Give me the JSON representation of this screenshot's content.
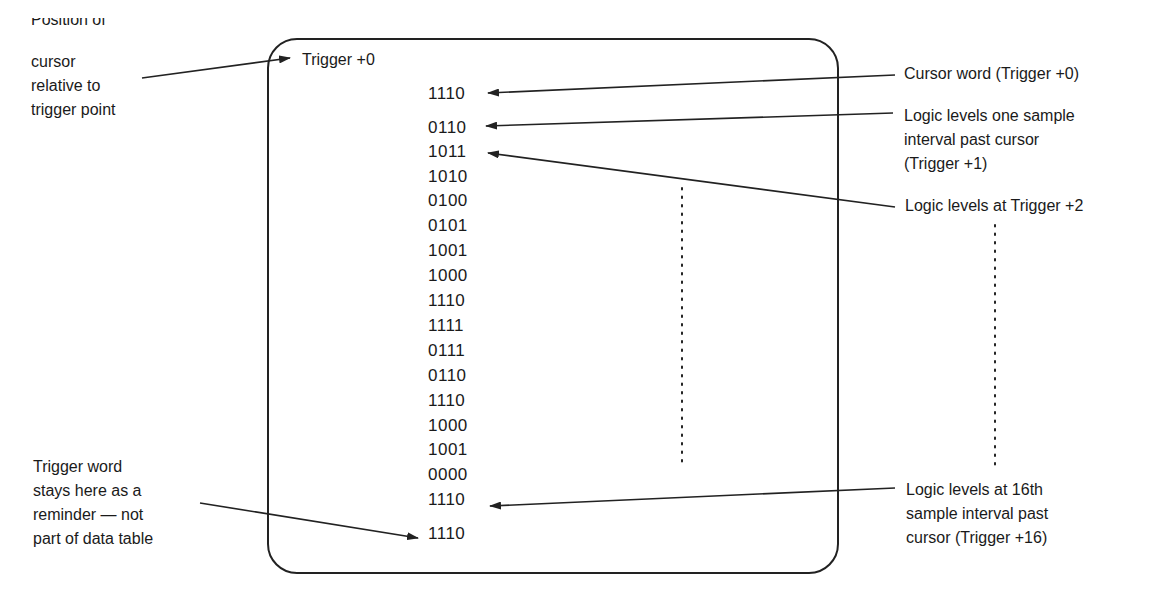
{
  "display": {
    "cursor_position_label": "Trigger +0",
    "data_rows": [
      "1110",
      "0110",
      "1011",
      "1010",
      "0100",
      "0101",
      "1001",
      "1000",
      "1110",
      "1111",
      "0111",
      "0110",
      "1110",
      "1000",
      "1001",
      "0000",
      "1110"
    ],
    "trigger_word_reminder": "1110"
  },
  "annotations": {
    "left": {
      "position_of_cursor_line1": "Position of",
      "position_of_cursor_rest": "cursor\nrelative to\ntrigger point",
      "trigger_word": "Trigger word\nstays here as a\nreminder — not\npart of data table"
    },
    "right": {
      "cursor_word": "Cursor word (Trigger +0)",
      "one_sample": "Logic levels one sample\ninterval past cursor\n(Trigger +1)",
      "trigger_plus_2": "Logic levels at Trigger +2",
      "trigger_plus_16": "Logic levels at 16th\nsample interval past\ncursor (Trigger +16)"
    }
  },
  "colors": {
    "ink": "#1a1a1a",
    "background": "#ffffff"
  }
}
